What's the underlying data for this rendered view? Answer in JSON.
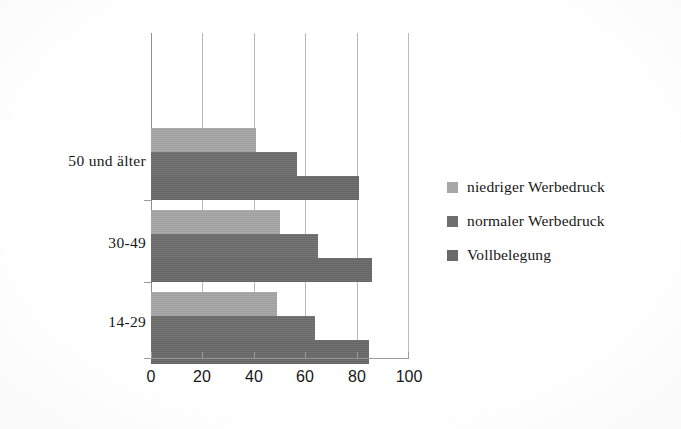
{
  "chart_data": {
    "type": "bar",
    "orientation": "horizontal",
    "title": "",
    "subtitle": "",
    "xlabel": "",
    "ylabel": "",
    "xlim": [
      0,
      100
    ],
    "xticks": [
      0,
      20,
      40,
      60,
      80,
      100
    ],
    "xtick_labels": [
      "0",
      "20",
      "40",
      "60",
      "80",
      "100"
    ],
    "categories": [
      "14-29",
      "30-49",
      "50 und älter"
    ],
    "grid": "vertical",
    "legend_position": "right",
    "series": [
      {
        "name": "niedriger Werbedruck",
        "color": "#a6a6a6",
        "values": [
          49,
          50,
          41
        ]
      },
      {
        "name": "normaler Werbedruck",
        "color": "#6e6e6e",
        "values": [
          64,
          65,
          57
        ]
      },
      {
        "name": "Vollbelegung",
        "color": "#6a6a6a",
        "values": [
          85,
          86,
          81
        ]
      }
    ]
  },
  "legend": {
    "items": [
      {
        "label": "niedriger Werbedruck",
        "color": "#a6a6a6"
      },
      {
        "label": "normaler Werbedruck",
        "color": "#6e6e6e"
      },
      {
        "label": "Vollbelegung",
        "color": "#6a6a6a"
      }
    ]
  },
  "axis": {
    "x_tick_labels": [
      "0",
      "20",
      "40",
      "60",
      "80",
      "100"
    ],
    "category_labels": [
      "14-29",
      "30-49",
      "50 und älter"
    ]
  },
  "colors": {
    "gridline": "#b9b9b9",
    "axis": "#9a9a9a",
    "text": "#171717",
    "background": "#ffffff"
  }
}
